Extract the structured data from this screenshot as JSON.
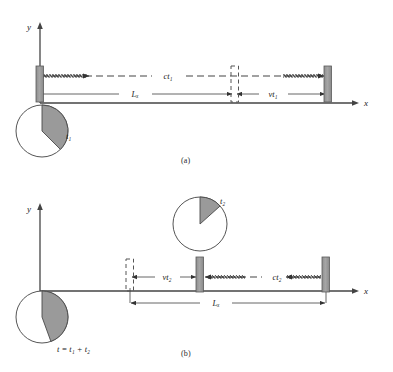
{
  "figure": {
    "type": "physics-diagram",
    "background_color": "#ffffff",
    "ink_color": "#333333",
    "mirror_fill": "#9a9a9a",
    "mirror_stroke": "#555555",
    "clock_wedge_fill": "#9a9a9a"
  },
  "panel_a": {
    "caption": "(a)",
    "axis": {
      "x_label": "x",
      "y_label": "y"
    },
    "labels": {
      "light_path": "ct₁",
      "length": "Lₓ",
      "displacement": "vt₁",
      "clock": "t₁"
    },
    "clock": {
      "name": "t₁",
      "wedge_start_deg": 0,
      "wedge_end_deg": 135,
      "center_x": 42,
      "center_y": 131,
      "radius": 26
    },
    "mirrors": [
      {
        "name": "left-mirror",
        "x": 36,
        "y": 66,
        "w": 7,
        "h": 35,
        "style": "solid"
      },
      {
        "name": "ghost-mirror",
        "x": 231,
        "y": 66,
        "w": 7,
        "h": 35,
        "style": "dashed"
      },
      {
        "name": "right-mirror",
        "x": 324,
        "y": 66,
        "w": 7,
        "h": 35,
        "style": "solid"
      }
    ],
    "arrows": {
      "light_beam_outbound": {
        "from_x": 40,
        "to_x": 90,
        "y": 76
      },
      "light_beam_return": {
        "from_x": 283,
        "to_x": 325,
        "y": 76
      },
      "length_span": {
        "from_x": 40,
        "to_x": 231,
        "y": 94
      },
      "displacement_span": {
        "from_x": 236,
        "to_x": 325,
        "y": 94
      }
    }
  },
  "panel_b": {
    "caption": "(b)",
    "axis": {
      "x_label": "x",
      "y_label": "y"
    },
    "labels": {
      "light_path": "ct₂",
      "length": "Lₓ",
      "displacement": "vt₂",
      "clock_upper": "t₂",
      "clock_lower": "t = t₁ + t₂"
    },
    "clock_upper": {
      "name": "t₂",
      "wedge_start_deg": 0,
      "wedge_end_deg": 48,
      "center_x": 200,
      "center_y": 224,
      "radius": 27
    },
    "clock_lower": {
      "name": "t = t₁ + t₂",
      "wedge_start_deg": 0,
      "wedge_end_deg": 160,
      "center_x": 42,
      "center_y": 317,
      "radius": 26
    },
    "mirrors": [
      {
        "name": "ghost-mirror",
        "x": 126,
        "y": 259,
        "w": 7,
        "h": 27,
        "style": "dashed"
      },
      {
        "name": "middle-mirror",
        "x": 196,
        "y": 259,
        "w": 7,
        "h": 35,
        "style": "solid"
      },
      {
        "name": "right-mirror",
        "x": 322,
        "y": 259,
        "w": 7,
        "h": 35,
        "style": "solid"
      }
    ],
    "arrows": {
      "displacement_span": {
        "from_x": 131,
        "to_x": 196,
        "y": 278
      },
      "light_beam_return": {
        "from_x": 203,
        "to_x": 245,
        "y": 277
      },
      "light_beam_inbound": {
        "from_x": 285,
        "to_x": 322,
        "y": 277
      },
      "length_span": {
        "from_x": 131,
        "to_x": 325,
        "y": 303
      }
    }
  }
}
